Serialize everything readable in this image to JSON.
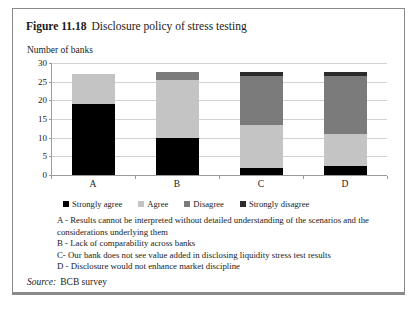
{
  "figure": {
    "number": "Figure 11.18",
    "caption": "Disclosure policy of stress testing",
    "axis_title": "Number of banks",
    "source_label": "Source:",
    "source_value": "BCB survey"
  },
  "footnotes": [
    "A - Results cannot be interpreted without detailed understanding of the scenarios and the considerations underlying them",
    "B -  Lack of comparability across banks",
    "C-  Our bank does not see value added in disclosing liquidity stress test results",
    "D - Disclosure would not enhance market discipline"
  ],
  "colors": {
    "strongly_agree": "#000000",
    "agree": "#c4c4c4",
    "disagree": "#7b7b7b",
    "strongly_disagree": "#2b2b2b",
    "gridline": "#d2d2d2",
    "axis": "#9b9b9b",
    "border": "#8a8a8a"
  },
  "chart_data": {
    "type": "bar",
    "title": "Disclosure policy of stress testing",
    "xlabel": "",
    "ylabel": "Number of banks",
    "ylim": [
      0,
      30
    ],
    "yticks": [
      0,
      5,
      10,
      15,
      20,
      25,
      30
    ],
    "grid": true,
    "stacked": true,
    "legend_position": "bottom",
    "categories": [
      "A",
      "B",
      "C",
      "D"
    ],
    "series": [
      {
        "name": "Strongly agree",
        "values": [
          19,
          10,
          2,
          2.5
        ]
      },
      {
        "name": "Agree",
        "values": [
          8,
          15.5,
          11.5,
          8.5
        ]
      },
      {
        "name": "Disagree",
        "values": [
          0,
          2,
          13,
          15.5
        ]
      },
      {
        "name": "Strongly disagree",
        "values": [
          0,
          0,
          1,
          1
        ]
      }
    ],
    "totals": [
      27,
      27.5,
      27.5,
      27.5
    ]
  }
}
